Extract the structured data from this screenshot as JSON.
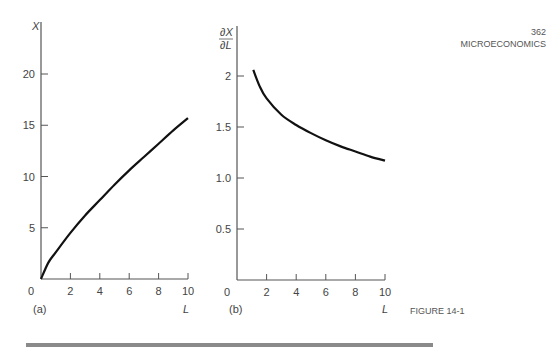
{
  "page_header": {
    "page_number": "362",
    "section": "MICROECONOMICS"
  },
  "figure_caption": "FIGURE 14-1",
  "chart_data": [
    {
      "type": "line",
      "panel": "(a)",
      "title": "",
      "xlabel": "L",
      "ylabel": "X",
      "xlim": [
        0,
        10
      ],
      "ylim": [
        0,
        23
      ],
      "xticks": [
        "0",
        "2",
        "4",
        "6",
        "8",
        "10"
      ],
      "yticks": [
        "5",
        "10",
        "15",
        "20"
      ],
      "grid": false,
      "x": [
        0,
        0.5,
        1,
        2,
        3,
        4,
        5,
        6,
        7,
        8,
        9,
        10
      ],
      "values": [
        0,
        1.6,
        2.6,
        4.5,
        6.2,
        7.7,
        9.2,
        10.6,
        11.9,
        13.2,
        14.5,
        15.7
      ]
    },
    {
      "type": "line",
      "panel": "(b)",
      "title": "",
      "xlabel": "L",
      "ylabel": "∂X/∂L",
      "xlim": [
        0,
        10
      ],
      "ylim": [
        0,
        2.3
      ],
      "xticks": [
        "0",
        "2",
        "4",
        "6",
        "8",
        "10"
      ],
      "yticks": [
        "0.5",
        "1.0",
        "1.5",
        "2"
      ],
      "grid": false,
      "x": [
        1.1,
        1.5,
        2,
        3,
        4,
        5,
        6,
        7,
        8,
        9,
        10
      ],
      "values": [
        2.06,
        1.91,
        1.78,
        1.62,
        1.52,
        1.44,
        1.37,
        1.31,
        1.26,
        1.21,
        1.17
      ]
    }
  ]
}
